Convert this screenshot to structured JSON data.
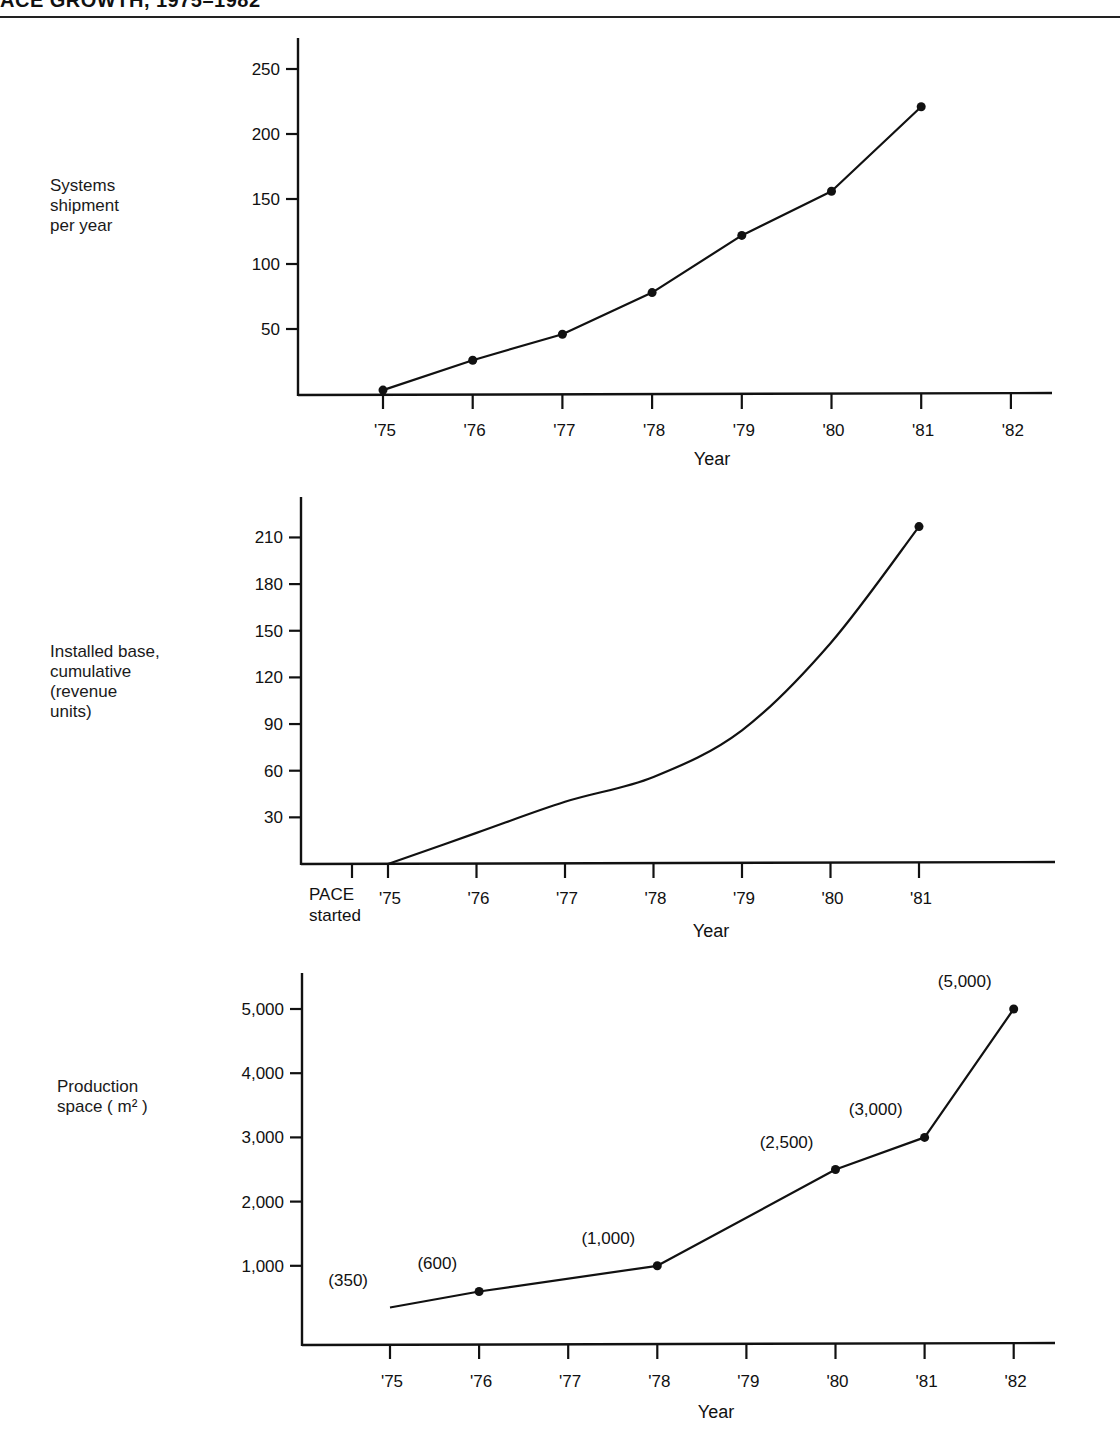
{
  "page": {
    "title": "ACE GROWTH, 1975–1982"
  },
  "chart_data": [
    {
      "id": "shipments",
      "type": "line",
      "title": "",
      "ylabel_lines": [
        "Systems",
        "shipment",
        "per year"
      ],
      "xlabel": "Year",
      "x_ticks": [
        "'75",
        "'76",
        "'77",
        "'78",
        "'79",
        "'80",
        "'81",
        "'82"
      ],
      "y_ticks": [
        50,
        100,
        150,
        200,
        250
      ],
      "y_tick_labels": [
        "50",
        "100",
        "150",
        "200",
        "250"
      ],
      "ylim": [
        0,
        270
      ],
      "series": [
        {
          "name": "Systems shipment per year",
          "x": [
            "'75",
            "'76",
            "'77",
            "'78",
            "'79",
            "'80",
            "'81"
          ],
          "values": [
            3,
            26,
            46,
            78,
            122,
            156,
            221
          ],
          "markers": true
        }
      ],
      "grid": false
    },
    {
      "id": "installed-base",
      "type": "line",
      "title": "",
      "ylabel_lines": [
        "Installed base,",
        "cumulative",
        "(revenue",
        "units)"
      ],
      "xlabel": "Year",
      "x_ticks": [
        "'75",
        "'76",
        "'77",
        "'78",
        "'79",
        "'80",
        "'81"
      ],
      "extra_tick": {
        "label_lines": [
          "PACE",
          "started"
        ]
      },
      "y_ticks": [
        30,
        60,
        90,
        120,
        150,
        180,
        210
      ],
      "y_tick_labels": [
        "30",
        "60",
        "90",
        "120",
        "150",
        "180",
        "210"
      ],
      "ylim": [
        0,
        235
      ],
      "series": [
        {
          "name": "Installed base, cumulative",
          "x": [
            "'75",
            "'76",
            "'77",
            "'78",
            "'79",
            "'80",
            "'81"
          ],
          "values": [
            0,
            20,
            40,
            56,
            86,
            142,
            217
          ],
          "smooth": true,
          "end_marker": true
        }
      ],
      "grid": false
    },
    {
      "id": "production-space",
      "type": "line",
      "title": "",
      "ylabel_lines": [
        "Production",
        "space ( m² )"
      ],
      "xlabel": "Year",
      "x_ticks": [
        "'75",
        "'76",
        "'77",
        "'78",
        "'79",
        "'80",
        "'81",
        "'82"
      ],
      "y_ticks": [
        1000,
        2000,
        3000,
        4000,
        5000
      ],
      "y_tick_labels": [
        "1,000",
        "2,000",
        "3,000",
        "4,000",
        "5,000"
      ],
      "ylim": [
        0,
        5500
      ],
      "series": [
        {
          "name": "Production space (m²)",
          "x": [
            "'75",
            "'76",
            "'78",
            "'80",
            "'81",
            "'82"
          ],
          "values": [
            350,
            600,
            1000,
            2500,
            3000,
            5000
          ],
          "data_labels": [
            "(350)",
            "(600)",
            "(1,000)",
            "(2,500)",
            "(3,000)",
            "(5,000)"
          ],
          "markers": [
            false,
            true,
            true,
            true,
            true,
            true
          ]
        }
      ],
      "grid": false
    }
  ]
}
